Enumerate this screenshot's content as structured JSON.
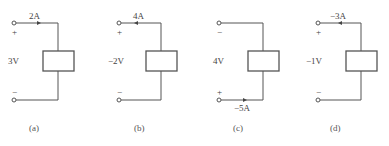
{
  "figure": {
    "panels": [
      {
        "id": "a",
        "caption": "(a)",
        "voltage": "3V",
        "current": "2A",
        "top_polarity": "+",
        "bottom_polarity": "−",
        "current_position": "top",
        "arrow_direction": "right"
      },
      {
        "id": "b",
        "caption": "(b)",
        "voltage": "−2V",
        "current": "4A",
        "top_polarity": "+",
        "bottom_polarity": "−",
        "current_position": "top",
        "arrow_direction": "left"
      },
      {
        "id": "c",
        "caption": "(c)",
        "voltage": "4V",
        "current": "−5A",
        "top_polarity": "−",
        "bottom_polarity": "+",
        "current_position": "bottom",
        "arrow_direction": "right"
      },
      {
        "id": "d",
        "caption": "(d)",
        "voltage": "−1V",
        "current": "−3A",
        "top_polarity": "+",
        "bottom_polarity": "−",
        "current_position": "top",
        "arrow_direction": "left"
      }
    ],
    "colors": {
      "line": "#555555",
      "text": "#444444",
      "background": "#ffffff"
    }
  }
}
